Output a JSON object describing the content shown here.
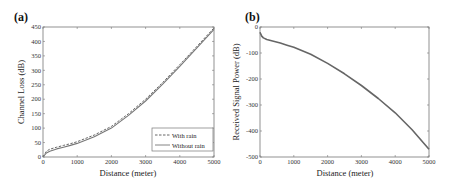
{
  "chart_data": [
    {
      "type": "line",
      "panel_label": "(a)",
      "title": "",
      "xlabel": "Distance (meter)",
      "ylabel": "Channel Loss (dB)",
      "xlim": [
        0,
        5000
      ],
      "ylim": [
        0,
        450
      ],
      "xticks": [
        0,
        1000,
        2000,
        3000,
        4000,
        5000
      ],
      "yticks": [
        0,
        50,
        100,
        150,
        200,
        250,
        300,
        350,
        400,
        450
      ],
      "grid": false,
      "legend_position": "lower right",
      "x": [
        0,
        100,
        200,
        400,
        600,
        800,
        1000,
        1500,
        2000,
        2500,
        3000,
        3500,
        4000,
        4500,
        5000
      ],
      "series": [
        {
          "name": "With rain",
          "style": "dashed",
          "color": "#555555",
          "values": [
            0,
            20,
            27,
            34,
            40,
            46,
            53,
            76,
            106,
            150,
            200,
            258,
            320,
            383,
            447
          ]
        },
        {
          "name": "Without rain",
          "style": "solid",
          "color": "#777777",
          "values": [
            0,
            14,
            20,
            28,
            34,
            40,
            47,
            70,
            100,
            144,
            194,
            252,
            314,
            378,
            442
          ]
        }
      ]
    },
    {
      "type": "line",
      "panel_label": "(b)",
      "title": "",
      "xlabel": "Distance (meter)",
      "ylabel": "Received Signal Power (dB)",
      "xlim": [
        0,
        5000
      ],
      "ylim": [
        -500,
        0
      ],
      "xticks": [
        0,
        1000,
        2000,
        3000,
        4000,
        5000
      ],
      "yticks": [
        0,
        -100,
        -200,
        -300,
        -400,
        -500
      ],
      "grid": false,
      "legend_position": "none",
      "x": [
        0,
        50,
        100,
        200,
        400,
        600,
        800,
        1000,
        1500,
        2000,
        2500,
        3000,
        3500,
        4000,
        4500,
        5000
      ],
      "series": [
        {
          "name": "Received Signal Power",
          "style": "solid",
          "color": "#666666",
          "values": [
            -20,
            -35,
            -42,
            -48,
            -55,
            -62,
            -70,
            -78,
            -105,
            -140,
            -180,
            -225,
            -275,
            -330,
            -395,
            -470
          ]
        }
      ]
    }
  ],
  "labels": {
    "a": {
      "panel": "(a)",
      "xlabel": "Distance (meter)",
      "ylabel": "Channel Loss (dB)",
      "legend": [
        "With rain",
        "Without rain"
      ]
    },
    "b": {
      "panel": "(b)",
      "xlabel": "Distance (meter)",
      "ylabel": "Received Signal Power (dB)"
    }
  }
}
